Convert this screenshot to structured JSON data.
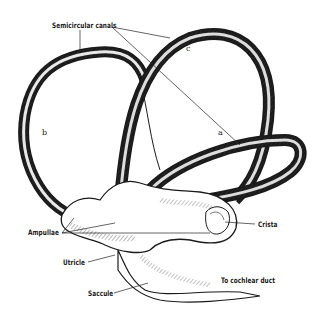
{
  "figure": {
    "type": "anatomical illustration",
    "background": "#ffffff",
    "ink_color": "#1a1a1a"
  },
  "labels": {
    "semicircular_canals": "Semicircular canals",
    "canal_a": "a",
    "canal_b": "b",
    "canal_c": "c",
    "ampullae": "Ampullae",
    "crista": "Crista",
    "utricle": "Utricle",
    "saccule": "Saccule",
    "cochlear_duct": "To cochlear duct"
  }
}
